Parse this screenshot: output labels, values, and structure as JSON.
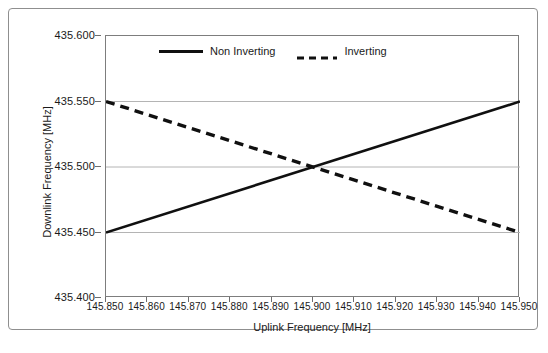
{
  "figure": {
    "caption": ""
  },
  "chart_data": {
    "type": "line",
    "title": "",
    "xlabel": "Uplink Frequency [MHz]",
    "ylabel": "Downlink Frequency [MHz]",
    "xlim": [
      145.85,
      145.95
    ],
    "ylim": [
      435.4,
      435.6
    ],
    "xticks": [
      145.85,
      145.86,
      145.87,
      145.88,
      145.89,
      145.9,
      145.91,
      145.92,
      145.93,
      145.94,
      145.95
    ],
    "xtick_labels": [
      "145.850",
      "145.860",
      "145.870",
      "145.880",
      "145.890",
      "145.900",
      "145.910",
      "145.920",
      "145.930",
      "145.940",
      "145.950"
    ],
    "yticks": [
      435.4,
      435.45,
      435.5,
      435.55,
      435.6
    ],
    "ytick_labels": [
      "435.400",
      "435.450",
      "435.500",
      "435.550",
      "435.600"
    ],
    "grid": "horizontal",
    "legend_position": "top-center",
    "series": [
      {
        "name": "Non Inverting",
        "style": "solid",
        "color": "#101010",
        "x": [
          145.85,
          145.95
        ],
        "values": [
          435.45,
          435.55
        ]
      },
      {
        "name": "Inverting",
        "style": "dashed",
        "color": "#101010",
        "x": [
          145.85,
          145.95
        ],
        "values": [
          435.55,
          435.45
        ]
      }
    ],
    "intersection": {
      "x": 145.9,
      "y": 435.5
    }
  },
  "legend": {
    "entries": [
      {
        "label": "Non Inverting"
      },
      {
        "label": "Inverting"
      }
    ]
  },
  "axes": {
    "x_title": "Uplink Frequency [MHz]",
    "y_title": "Downlink Frequency [MHz]"
  }
}
